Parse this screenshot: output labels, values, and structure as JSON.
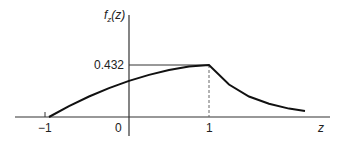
{
  "chart_data": {
    "type": "line",
    "title": "",
    "xlabel": "z",
    "ylabel": "f_z(z)",
    "ylabel_parts": {
      "f": "f",
      "sub": "z",
      "arg": "(z)"
    },
    "x_ticks": [
      "−1",
      "0",
      "1"
    ],
    "x_tick_values": [
      -1,
      0,
      1
    ],
    "y_ticks": [
      "0.432"
    ],
    "y_tick_values": [
      0.432
    ],
    "xlim": [
      -1.4,
      2.5
    ],
    "ylim": [
      0,
      0.6
    ],
    "grid": false,
    "legend": null,
    "annotations": [
      {
        "type": "hline_segment",
        "y": 0.432,
        "from_x": 0,
        "to_x": 1,
        "style": "solid"
      },
      {
        "type": "vline_segment",
        "x": 1,
        "from_y": 0,
        "to_y": 0.432,
        "style": "dashed"
      }
    ],
    "series": [
      {
        "name": "f_z(z)",
        "x": [
          -1.0,
          -0.75,
          -0.5,
          -0.25,
          0.0,
          0.25,
          0.5,
          0.75,
          1.0,
          1.25,
          1.5,
          1.75,
          2.0,
          2.2
        ],
        "y": [
          0.0,
          0.09,
          0.17,
          0.24,
          0.3,
          0.35,
          0.39,
          0.42,
          0.432,
          0.27,
          0.17,
          0.11,
          0.07,
          0.05
        ]
      }
    ]
  }
}
